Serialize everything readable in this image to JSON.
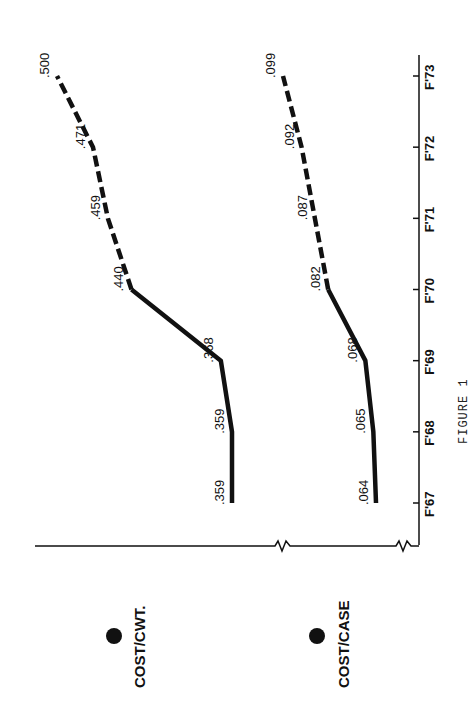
{
  "figure": {
    "caption": "FIGURE 1",
    "ink_color": "#111111",
    "background": "#ffffff"
  },
  "legend": [
    {
      "label": "COST/CWT.",
      "marker": "filled-circle"
    },
    {
      "label": "COST/CASE",
      "marker": "filled-circle"
    }
  ],
  "chart_data": {
    "type": "line",
    "orientation": "rotated 90° counter-clockwise (x-axis runs vertically on the right, values increase leftward)",
    "title": "",
    "caption": "FIGURE 1",
    "xlabel": "",
    "ylabel": "",
    "categories": [
      "F'67",
      "F'68",
      "F'69",
      "F'70",
      "F'71",
      "F'72",
      "F'73"
    ],
    "axis_breaks": true,
    "grid": false,
    "legend_position": "bottom (left side when rotated)",
    "series": [
      {
        "name": "COST/CWT.",
        "values": [
          0.359,
          0.359,
          0.368,
          0.44,
          0.459,
          0.471,
          0.5
        ],
        "labels": [
          ".359",
          ".359",
          ".368",
          ".440",
          ".459",
          ".471",
          ".500"
        ],
        "solid_until": "F'70",
        "dashed_from": "F'70"
      },
      {
        "name": "COST/CASE",
        "values": [
          0.064,
          0.065,
          0.068,
          0.082,
          0.087,
          0.092,
          0.099
        ],
        "labels": [
          ".064",
          ".065",
          ".068",
          ".082",
          ".087",
          ".092",
          ".099"
        ],
        "solid_until": "F'70",
        "dashed_from": "F'70"
      }
    ]
  }
}
